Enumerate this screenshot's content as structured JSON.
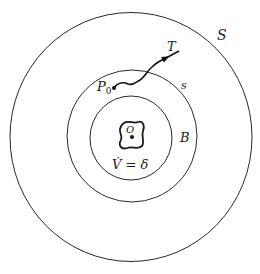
{
  "diagram": {
    "labels": {
      "outer_circle": "S",
      "middle_circle": "s",
      "inner_circle": "B",
      "start_point": "P",
      "start_point_subscript": "0",
      "trajectory": "T",
      "origin": "O",
      "equation": "V̇ = δ"
    },
    "colors": {
      "stroke": "#2a2a2a",
      "background": "#ffffff"
    }
  }
}
